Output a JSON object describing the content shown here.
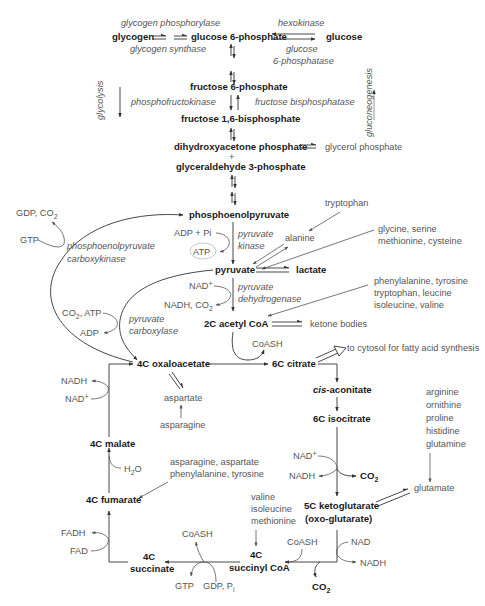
{
  "colors": {
    "metabolite": "#1a1a1a",
    "secondary": "#555555",
    "arrow": "#333333",
    "background": "#ffffff"
  },
  "metabolites": {
    "glycogen": "glycogen",
    "g6p": "glucose 6-phosphate",
    "glucose": "glucose",
    "f6p": "fructose 6-phosphate",
    "f16bp": "fructose 1,6-bisphosphate",
    "dhap": "dihydroxyacetone phosphate",
    "plus": "+",
    "g3p": "glyceraldehyde 3-phosphate",
    "pep": "phosphoenolpyruvate",
    "pyruvate": "pyruvate",
    "lactate": "lactate",
    "acetylcoa": "2C acetyl CoA",
    "oaa": "4C oxaloacetate",
    "citrate": "6C citrate",
    "cisaconitate_pre": "cis",
    "cisaconitate_post": "-aconitate",
    "isocitrate": "6C isocitrate",
    "ketoglutarate": "5C ketoglutarate",
    "oxoglutarate": "(oxo-glutarate)",
    "succinylcoa_1": "4C",
    "succinylcoa_2": "succinyl CoA",
    "succinate_1": "4C",
    "succinate_2": "succinate",
    "fumarate": "4C fumarate",
    "malate": "4C malate"
  },
  "enzymes": {
    "glycogen_phosphorylase": "glycogen phosphorylase",
    "glycogen_synthase": "glycogen synthase",
    "hexokinase": "hexokinase",
    "g6pase_1": "glucose",
    "g6pase_2": "6-phosphatase",
    "pfk": "phosphofructokinase",
    "fbpase": "fructose bisphosphatase",
    "pk_1": "pyruvate",
    "pk_2": "kinase",
    "pepck_1": "phosphoenolpyruvate",
    "pepck_2": "carboxykinase",
    "pdh_1": "pyruvate",
    "pdh_2": "dehydrogenase",
    "pc_1": "pyruvate",
    "pc_2": "carboxylase"
  },
  "direction_labels": {
    "glycolysis": "glycolysis",
    "gluconeogenesis": "gluconeogenesis"
  },
  "side": {
    "glycerol_phosphate": "glycerol phosphate",
    "tryptophan": "tryptophan",
    "alanine": "alanine",
    "gly_1": "glycine, serine",
    "gly_2": "methionine, cysteine",
    "phe_1": "phenylalanine, tyrosine",
    "phe_2": "tryptophan, leucine",
    "phe_3": "isoleucine, valine",
    "ketone_bodies": "ketone bodies",
    "fatty_acid": "to cytosol for fatty acid synthesis",
    "aspartate": "aspartate",
    "asparagine": "asparagine",
    "asn_1": "asparagine, aspartate",
    "asn_2": "phenylalanine, tyrosine",
    "arg_1": "arginine",
    "arg_2": "ornithine",
    "arg_3": "proline",
    "arg_4": "histidine",
    "arg_5": "glutamine",
    "glutamate": "glutamate",
    "val_1": "valine",
    "val_2": "isoleucine",
    "val_3": "methionine"
  },
  "cofactors": {
    "gdp_co2": "GDP, CO",
    "gdp_co2_sub": "2",
    "gtp_top": "GTP",
    "adp_pi": "ADP + Pi",
    "atp": "ATP",
    "nad_pdh": "NAD",
    "nad_pdh_sup": "+",
    "nadh_co2": "NADH, CO",
    "nadh_co2_sub": "2",
    "co2_atp": "CO",
    "co2_atp_sub": "2",
    "co2_atp_post": ", ATP",
    "adp": "ADP",
    "coash_cs": "CoASH",
    "nadh_mdh": "NADH",
    "nad_mdh": "NAD",
    "nad_mdh_sup": "+",
    "h2o_pre": "H",
    "h2o_sub": "2",
    "h2o_post": "O",
    "nad_idh": "NAD",
    "nad_idh_sup": "+",
    "nadh_idh": "NADH",
    "co2_idh": "CO",
    "co2_idh_sub": "2",
    "fadh": "FADH",
    "fad": "FAD",
    "coash_scs": "CoASH",
    "gtp_scs": "GTP",
    "gdp_pi": "GDP, P",
    "gdp_pi_sub": "i",
    "coash_kgdh": "CoASH",
    "nad_kgdh": "NAD",
    "nadh_kgdh": "NADH",
    "co2_kgdh": "CO",
    "co2_kgdh_sub": "2"
  }
}
